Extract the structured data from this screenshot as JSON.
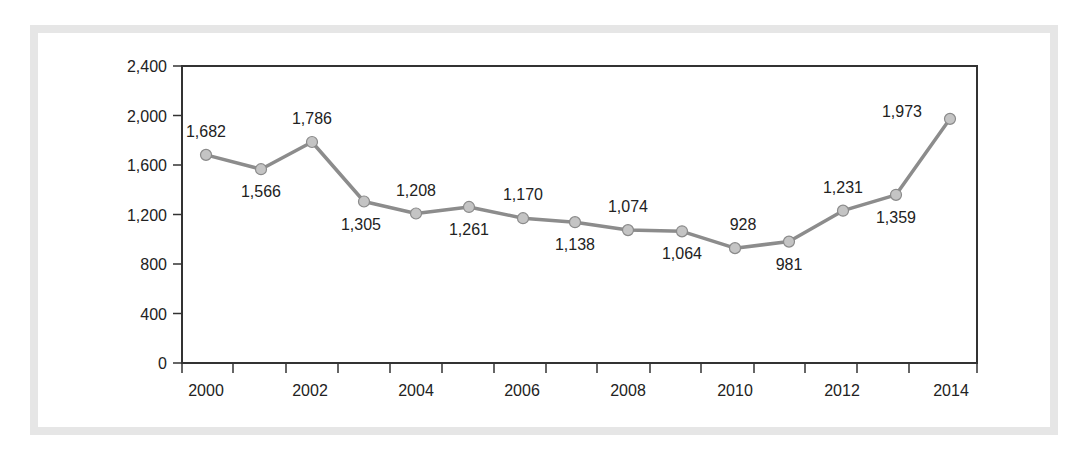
{
  "chart_data": {
    "type": "line",
    "title": "",
    "xlabel": "",
    "ylabel": "",
    "x": [
      2000,
      2001,
      2002,
      2003,
      2004,
      2005,
      2006,
      2007,
      2008,
      2009,
      2010,
      2011,
      2012,
      2013,
      2014
    ],
    "series": [
      {
        "name": "Value",
        "values": [
          1682,
          1566,
          1786,
          1305,
          1208,
          1261,
          1170,
          1138,
          1074,
          1064,
          928,
          981,
          1231,
          1359,
          1973
        ],
        "labels": [
          "1,682",
          "1,566",
          "1,786",
          "1,305",
          "1,208",
          "1,261",
          "1,170",
          "1,138",
          "1,074",
          "1,064",
          "928",
          "981",
          "1,231",
          "1,359",
          "1,973"
        ]
      }
    ],
    "yticks": [
      "0",
      "400",
      "800",
      "1,200",
      "1,600",
      "2,000",
      "2,400"
    ],
    "xticks": [
      "2000",
      "2002",
      "2004",
      "2006",
      "2008",
      "2010",
      "2012",
      "2014"
    ],
    "ylim": [
      0,
      2400
    ],
    "grid": false,
    "legend": "none",
    "colors": {
      "line": "#8c8c8c",
      "marker": "#c4c4c4",
      "axis": "#333333",
      "frame": "#e6e6e6"
    }
  }
}
